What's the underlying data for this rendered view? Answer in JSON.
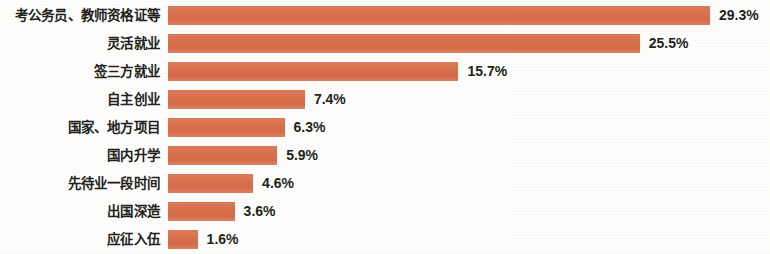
{
  "chart_data": {
    "type": "bar",
    "orientation": "horizontal",
    "title": "",
    "subtitle": "",
    "xlabel": "",
    "ylabel": "",
    "grid": false,
    "legend": null,
    "xlim": [
      0,
      29.3
    ],
    "unit": "%",
    "bar_color": "#d9714e",
    "text_color": "#231f20",
    "background_color": "#fdfdfb",
    "categories": [
      "考公务员、教师资格证等",
      "灵活就业",
      "签三方就业",
      "自主创业",
      "国家、地方项目",
      "国内升学",
      "先待业一段时间",
      "出国深造",
      "应征入伍"
    ],
    "values": [
      29.3,
      25.5,
      15.7,
      7.4,
      6.3,
      5.9,
      4.6,
      3.6,
      1.6
    ],
    "value_labels": [
      "29.3%",
      "25.5%",
      "15.7%",
      "7.4%",
      "6.3%",
      "5.9%",
      "4.6%",
      "3.6%",
      "1.6%"
    ]
  }
}
